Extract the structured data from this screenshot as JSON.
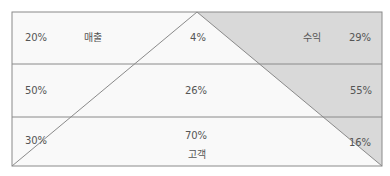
{
  "diagram": {
    "colors": {
      "background": "#f9f9f9",
      "shaded": "#d9d9d9",
      "line": "#8a8a8a",
      "text": "#555555"
    },
    "category_labels": {
      "left": "매출",
      "right": "수익",
      "bottom": "고객"
    },
    "rows": [
      {
        "left": "20%",
        "center": "4%",
        "right": "29%"
      },
      {
        "left": "50%",
        "center": "26%",
        "right": "55%"
      },
      {
        "left": "30%",
        "center": "70%",
        "right": "16%"
      }
    ]
  }
}
